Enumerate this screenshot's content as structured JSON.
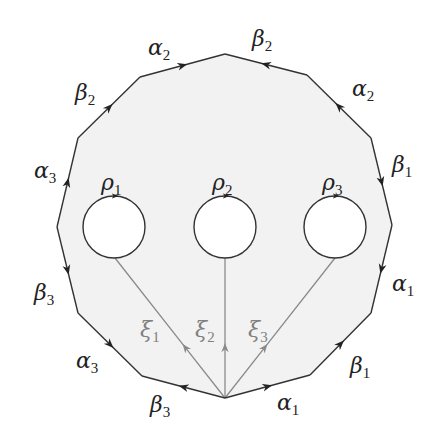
{
  "diagram": {
    "type": "fundamental-polygon",
    "colors": {
      "background": "#ffffff",
      "face_fill": "#f2f2f2",
      "edge": "#333333",
      "xi_line": "#8a8a8a",
      "xi_label": "#808080",
      "hole_fill": "#ffffff"
    },
    "polygon": {
      "vertices": [
        [
          225,
          54
        ],
        [
          307,
          75
        ],
        [
          371,
          138
        ],
        [
          392,
          225
        ],
        [
          371,
          313
        ],
        [
          310,
          375
        ],
        [
          225,
          398
        ],
        [
          142,
          376
        ],
        [
          78,
          313
        ],
        [
          57,
          227
        ],
        [
          78,
          138
        ],
        [
          140,
          77
        ]
      ]
    },
    "edges": [
      {
        "name": "beta2-top-right",
        "label": "β",
        "sub": "2",
        "label_pos": [
          252,
          46
        ]
      },
      {
        "name": "alpha2-right",
        "label": "α",
        "sub": "2",
        "label_pos": [
          352,
          96
        ]
      },
      {
        "name": "beta1-right",
        "label": "β",
        "sub": "1",
        "label_pos": [
          392,
          172
        ]
      },
      {
        "name": "alpha1-right",
        "label": "α",
        "sub": "1",
        "label_pos": [
          392,
          291
        ]
      },
      {
        "name": "beta1-bottom-right",
        "label": "β",
        "sub": "1",
        "label_pos": [
          350,
          373
        ]
      },
      {
        "name": "alpha1-bottom",
        "label": "α",
        "sub": "1",
        "label_pos": [
          277,
          410
        ]
      },
      {
        "name": "beta3-bottom",
        "label": "β",
        "sub": "3",
        "label_pos": [
          150,
          412
        ]
      },
      {
        "name": "alpha3-bottom-left",
        "label": "α",
        "sub": "3",
        "label_pos": [
          76,
          368
        ]
      },
      {
        "name": "beta3-left",
        "label": "β",
        "sub": "3",
        "label_pos": [
          34,
          300
        ]
      },
      {
        "name": "alpha3-left",
        "label": "α",
        "sub": "3",
        "label_pos": [
          34,
          178
        ]
      },
      {
        "name": "beta2-left",
        "label": "β",
        "sub": "2",
        "label_pos": [
          75,
          100
        ]
      },
      {
        "name": "alpha2-top-left",
        "label": "α",
        "sub": "2",
        "label_pos": [
          148,
          55
        ]
      }
    ],
    "holes": [
      {
        "name": "rho1",
        "label": "ρ",
        "sub": "1",
        "cx": 114,
        "cy": 227,
        "r": 31,
        "label_pos": [
          101,
          190
        ]
      },
      {
        "name": "rho2",
        "label": "ρ",
        "sub": "2",
        "cx": 225,
        "cy": 227,
        "r": 31,
        "label_pos": [
          212,
          190
        ]
      },
      {
        "name": "rho3",
        "label": "ρ",
        "sub": "3",
        "cx": 335,
        "cy": 227,
        "r": 31,
        "label_pos": [
          322,
          190
        ]
      }
    ],
    "xi_paths": [
      {
        "name": "xi1",
        "label": "ξ",
        "sub": "1",
        "to": [
          115,
          258
        ],
        "label_pos": [
          140,
          337
        ]
      },
      {
        "name": "xi2",
        "label": "ξ",
        "sub": "2",
        "to": [
          225,
          258
        ],
        "label_pos": [
          195,
          337
        ]
      },
      {
        "name": "xi3",
        "label": "ξ",
        "sub": "3",
        "to": [
          335,
          258
        ],
        "label_pos": [
          248,
          337
        ]
      }
    ],
    "base_point": [
      225,
      398
    ]
  }
}
